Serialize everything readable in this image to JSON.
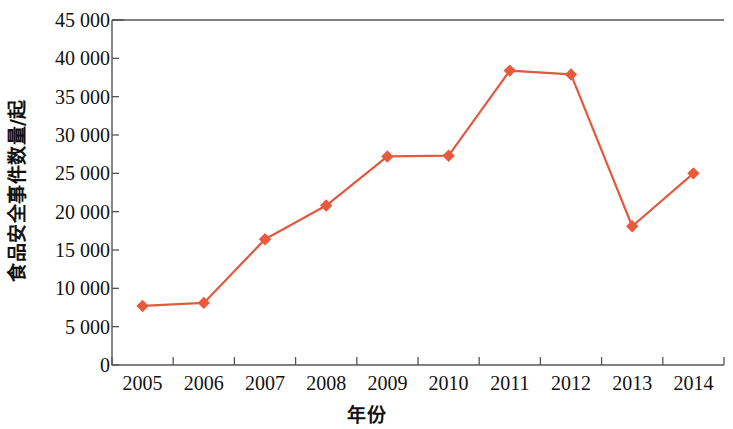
{
  "chart_data": {
    "type": "line",
    "title": "",
    "subtitle": "",
    "xlabel": "年份",
    "ylabel": "食品安全事件数量/起",
    "categories": [
      "2005",
      "2006",
      "2007",
      "2008",
      "2009",
      "2010",
      "2011",
      "2012",
      "2013",
      "2014"
    ],
    "series": [
      {
        "name": "食品安全事件数量",
        "values": [
          7700,
          8100,
          16400,
          20800,
          27200,
          27300,
          38400,
          37900,
          18100,
          25000
        ]
      }
    ],
    "ylim": [
      0,
      45000
    ],
    "y_ticks": [
      0,
      5000,
      10000,
      15000,
      20000,
      25000,
      30000,
      35000,
      40000,
      45000
    ],
    "y_tick_labels": [
      "0",
      "5 000",
      "10 000",
      "15 000",
      "20 000",
      "25 000",
      "30 000",
      "35 000",
      "40 000",
      "45 000"
    ],
    "grid": false,
    "legend": "none",
    "marker": "diamond",
    "colors": {
      "line": "#E2593F",
      "marker": "#E85A3C",
      "axis": "#555555",
      "text": "#111111"
    }
  },
  "axes": {
    "y_title": "食品安全事件数量/起",
    "x_title": "年份"
  }
}
